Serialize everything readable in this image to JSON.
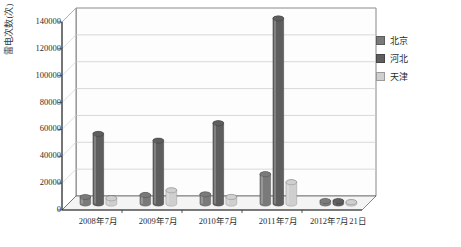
{
  "chart_data": {
    "type": "bar",
    "title": "",
    "xlabel": "",
    "ylabel": "雷电次数(次)",
    "categories": [
      "2008年7月",
      "2009年7月",
      "2010年7月",
      "2011年7月",
      "2012年7月21日"
    ],
    "series": [
      {
        "name": "北京",
        "color": "#7a7a7a",
        "values": [
          5000,
          6500,
          7000,
          22000,
          2000
        ]
      },
      {
        "name": "河北",
        "color": "#5e5e5e",
        "values": [
          52000,
          47000,
          60000,
          138000,
          2000
        ]
      },
      {
        "name": "天津",
        "color": "#cfcfcf",
        "values": [
          4000,
          10000,
          5000,
          16000,
          1200
        ]
      }
    ],
    "ylim": [
      0,
      140000
    ],
    "yticks": [
      0,
      20000,
      40000,
      60000,
      80000,
      100000,
      120000,
      140000
    ],
    "ytick_labels": [
      "0",
      "20000",
      "40000",
      "60000",
      "80000",
      "100000",
      "120000",
      "140000"
    ],
    "grid": true,
    "legend_position": "right",
    "style": "3d-cylinder"
  },
  "legend": {
    "items": [
      {
        "label": "北京",
        "color": "#7a7a7a"
      },
      {
        "label": "河北",
        "color": "#5e5e5e"
      },
      {
        "label": "天津",
        "color": "#cfcfcf"
      }
    ]
  },
  "axes": {
    "y_title": "雷电次数(次)",
    "y_tick_labels": [
      "140000",
      "120000",
      "100000",
      "80000",
      "60000",
      "40000",
      "20000",
      "0"
    ],
    "x_tick_labels": [
      "2008年7月",
      "2009年7月",
      "2010年7月",
      "2011年7月",
      "2012年7月21日"
    ]
  },
  "colors": {
    "plot_background": "#ffffff",
    "grid_line": "#c8c8c8",
    "axis_line": "#555555",
    "floor": "#e8e8e8",
    "back_wall": "#fdfdfd"
  }
}
